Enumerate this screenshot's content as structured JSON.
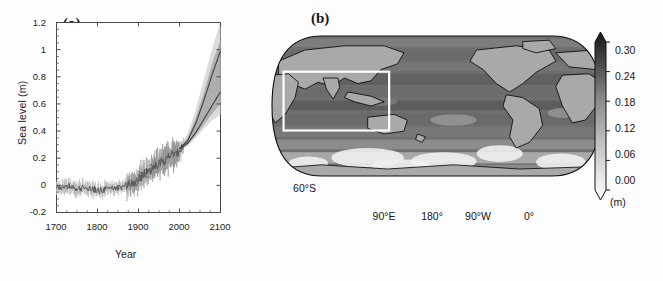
{
  "figure": {
    "background_color": "#ffffff"
  },
  "panel_a": {
    "label": "(a)",
    "chart_data": {
      "type": "line",
      "title": "",
      "xlabel": "Year",
      "ylabel": "Sea  level (m)",
      "xlim": [
        1700,
        2100
      ],
      "ylim": [
        -0.2,
        1.2
      ],
      "xticks": [
        1700,
        1800,
        1900,
        2000,
        2100
      ],
      "xtick_labels": [
        "1700",
        "1800",
        "1900",
        "2000",
        "2100"
      ],
      "yticks": [
        -0.2,
        0,
        0.2,
        0.4,
        0.6,
        0.8,
        1,
        1.2
      ],
      "ytick_labels": [
        "-0.2",
        "0",
        "0.2",
        "0.4",
        "0.6",
        "0.8",
        "1",
        "1.2"
      ],
      "grid": false,
      "legend": "none",
      "series": [
        {
          "name": "Proxy reconstruction (annual, noisy with error bars)",
          "color": "#555555",
          "style": "noisy-line-with-errorbars",
          "x": [
            1700,
            1710,
            1720,
            1730,
            1740,
            1750,
            1760,
            1770,
            1780,
            1790,
            1800,
            1810,
            1820,
            1830,
            1840,
            1850,
            1860,
            1870,
            1880,
            1890,
            1900,
            1910,
            1920,
            1930,
            1940,
            1950,
            1960,
            1970,
            1980,
            1990,
            2000,
            2010
          ],
          "values": [
            -0.01,
            -0.02,
            -0.02,
            -0.01,
            -0.02,
            -0.03,
            -0.02,
            -0.01,
            -0.02,
            -0.03,
            -0.03,
            -0.04,
            -0.03,
            -0.02,
            -0.02,
            -0.02,
            -0.01,
            0.0,
            0.01,
            0.03,
            0.05,
            0.07,
            0.09,
            0.11,
            0.14,
            0.16,
            0.18,
            0.2,
            0.22,
            0.24,
            0.26,
            0.28
          ]
        },
        {
          "name": "Tide gauge / instrumental record",
          "color": "#6e6e6e",
          "style": "points-with-errorbars",
          "x": [
            1880,
            1890,
            1900,
            1910,
            1920,
            1930,
            1940,
            1950,
            1960,
            1970,
            1980,
            1990,
            2000
          ],
          "values": [
            -0.03,
            -0.02,
            0.0,
            0.03,
            0.06,
            0.1,
            0.14,
            0.17,
            0.19,
            0.21,
            0.23,
            0.25,
            0.27
          ]
        },
        {
          "name": "Projection upper bound (95%)",
          "color": "#3f3f3f",
          "style": "line",
          "x": [
            2000,
            2020,
            2040,
            2060,
            2080,
            2100
          ],
          "values": [
            0.27,
            0.33,
            0.46,
            0.63,
            0.82,
            0.99
          ]
        },
        {
          "name": "Projection lower bound (5%)",
          "color": "#3f3f3f",
          "style": "line",
          "x": [
            2000,
            2020,
            2040,
            2060,
            2080,
            2100
          ],
          "values": [
            0.27,
            0.31,
            0.39,
            0.49,
            0.59,
            0.69
          ]
        }
      ],
      "uncertainty_bands": [
        {
          "name": "Projection full range (light)",
          "color": "#d5d5d5",
          "x": [
            2000,
            2020,
            2040,
            2060,
            2080,
            2100
          ],
          "upper": [
            0.29,
            0.38,
            0.56,
            0.79,
            1.01,
            1.21
          ],
          "lower": [
            0.25,
            0.29,
            0.35,
            0.42,
            0.48,
            0.52
          ]
        },
        {
          "name": "Projection likely range (dark)",
          "color": "#a8a8a8",
          "x": [
            2000,
            2020,
            2040,
            2060,
            2080,
            2100
          ],
          "upper": [
            0.28,
            0.35,
            0.5,
            0.69,
            0.9,
            1.07
          ],
          "lower": [
            0.26,
            0.3,
            0.37,
            0.45,
            0.53,
            0.6
          ]
        },
        {
          "name": "Historical reconstruction uncertainty",
          "color": "#cfcfcf",
          "x": [
            1700,
            1800,
            1900,
            2000
          ],
          "upper": [
            0.04,
            0.03,
            0.09,
            0.28
          ],
          "lower": [
            -0.07,
            -0.09,
            -0.02,
            0.26
          ]
        }
      ]
    }
  },
  "panel_b": {
    "label": "(b)",
    "chart_data": {
      "type": "heatmap",
      "title": "",
      "projection": "robinson",
      "center_longitude": 150,
      "lat_ticks": [
        60,
        30,
        0,
        -30,
        -60
      ],
      "lat_tick_labels": [
        "60°N",
        "30°N",
        "0°",
        "30°S",
        "60°S"
      ],
      "lon_ticks": [
        90,
        180,
        270,
        360
      ],
      "lon_tick_labels": [
        "90°E",
        "180°",
        "90°W",
        "0°"
      ],
      "colorbar": {
        "unit": "(m)",
        "vmin": 0.0,
        "vmax": 0.3,
        "ticks": [
          0.0,
          0.06,
          0.12,
          0.18,
          0.24,
          0.3
        ],
        "tick_labels": [
          "0.00",
          "0.06",
          "0.12",
          "0.18",
          "0.24",
          "0.30"
        ],
        "extend": "both",
        "colormap": "grayscale-reversed",
        "low_color": "#ffffff",
        "high_color": "#1a1a1a"
      },
      "highlight_box": {
        "name": "indian-ocean-region",
        "color": "#ffffff",
        "lat_range": [
          30,
          -35
        ],
        "lon_range": [
          30,
          120
        ]
      },
      "land_color": "#a9a9a9",
      "coastline_color": "#000000"
    }
  }
}
